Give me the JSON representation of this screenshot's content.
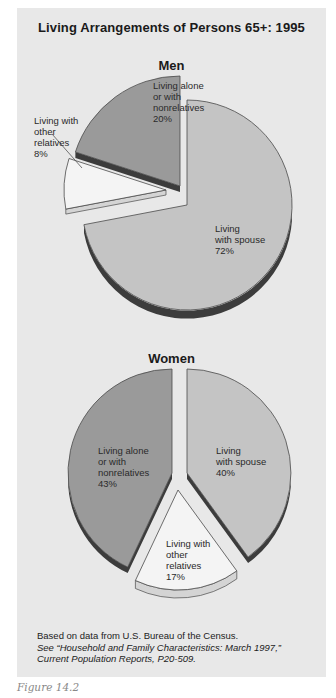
{
  "figure": {
    "title": "Living Arrangements of Persons 65+: 1995",
    "caption": "Figure 14.2",
    "source_line1": "Based on data from U.S. Bureau of the Census.",
    "source_line2": "See “Household and Family Characteristics: March 1997,”",
    "source_line3": "Current Population Reports, P20-509."
  },
  "colors": {
    "background": "#e8e8e8",
    "spouse": "#c4c4c4",
    "alone": "#9a9a9a",
    "other": "#f4f4f4",
    "edge": "#4a4a4a",
    "rim_dark": "#3c3c3c"
  },
  "men": {
    "label": "Men",
    "slices": {
      "spouse": "Living\nwith spouse\n72%",
      "alone": "Living alone\nor with\nnonrelatives\n20%",
      "other": "Living with\nother\nrelatives\n8%"
    }
  },
  "women": {
    "label": "Women",
    "slices": {
      "spouse": "Living\nwith spouse\n40%",
      "alone": "Living alone\nor with\nnonrelatives\n43%",
      "other": "Living with\nother\nrelatives\n17%"
    }
  },
  "chart_data": [
    {
      "type": "pie",
      "title": "Living Arrangements of Persons 65+: 1995 — Men",
      "categories": [
        "Living with spouse",
        "Living alone or with nonrelatives",
        "Living with other relatives"
      ],
      "values": [
        72,
        20,
        8
      ],
      "unit": "%",
      "exploded": true,
      "style": "3d"
    },
    {
      "type": "pie",
      "title": "Living Arrangements of Persons 65+: 1995 — Women",
      "categories": [
        "Living with spouse",
        "Living alone or with nonrelatives",
        "Living with other relatives"
      ],
      "values": [
        40,
        43,
        17
      ],
      "unit": "%",
      "exploded": true,
      "style": "3d"
    }
  ]
}
